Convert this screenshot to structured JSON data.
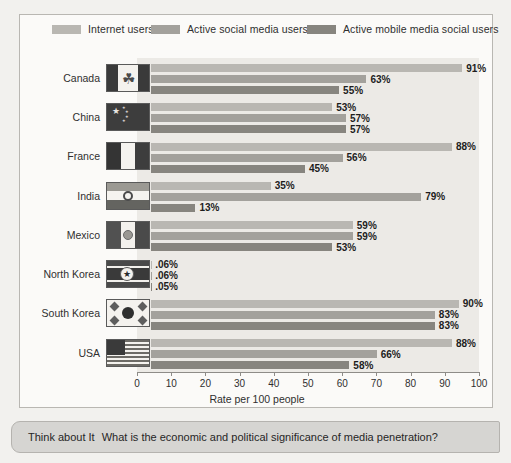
{
  "chart_data": {
    "type": "bar",
    "orientation": "horizontal",
    "title": "",
    "xlabel": "Rate per 100 people",
    "ylabel": "",
    "xlim": [
      0,
      100
    ],
    "xticks": [
      0,
      10,
      20,
      30,
      40,
      50,
      60,
      70,
      80,
      90,
      100
    ],
    "grid": false,
    "legend_position": "top",
    "categories": [
      "Canada",
      "China",
      "France",
      "India",
      "Mexico",
      "North Korea",
      "South Korea",
      "USA"
    ],
    "series": [
      {
        "name": "Internet users",
        "color": "#b9b7b2",
        "values": [
          91,
          53,
          88,
          35,
          59,
          0.06,
          90,
          88
        ],
        "labels": [
          "91%",
          "53%",
          "88%",
          "35%",
          "59%",
          ".06%",
          "90%",
          "88%"
        ]
      },
      {
        "name": "Active social media users",
        "color": "#a3a19c",
        "values": [
          63,
          57,
          56,
          79,
          59,
          0.06,
          83,
          66
        ],
        "labels": [
          "63%",
          "57%",
          "56%",
          "79%",
          "59%",
          ".06%",
          "83%",
          "66%"
        ]
      },
      {
        "name": "Active mobile media social users",
        "color": "#87857f",
        "values": [
          55,
          57,
          45,
          13,
          53,
          0.05,
          83,
          58
        ],
        "labels": [
          "55%",
          "57%",
          "45%",
          "13%",
          "53%",
          ".05%",
          "83%",
          "58%"
        ]
      }
    ]
  },
  "legend": {
    "items": [
      {
        "label": "Internet users",
        "swatch": "#b9b7b2"
      },
      {
        "label": "Active social media users",
        "swatch": "#a3a19c"
      },
      {
        "label": "Active mobile media social users",
        "swatch": "#87857f"
      }
    ]
  },
  "axis": {
    "title": "Rate per 100 people",
    "ticks": [
      "0",
      "10",
      "20",
      "30",
      "40",
      "50",
      "60",
      "70",
      "80",
      "90",
      "100"
    ]
  },
  "rows": [
    {
      "country": "Canada",
      "flag": "flag-canada"
    },
    {
      "country": "China",
      "flag": "flag-china"
    },
    {
      "country": "France",
      "flag": "flag-france"
    },
    {
      "country": "India",
      "flag": "flag-india"
    },
    {
      "country": "Mexico",
      "flag": "flag-mexico"
    },
    {
      "country": "North Korea",
      "flag": "flag-north-korea"
    },
    {
      "country": "South Korea",
      "flag": "flag-south-korea"
    },
    {
      "country": "USA",
      "flag": "flag-usa"
    }
  ],
  "footer": {
    "label": "Think about It",
    "text": "What is the economic and political significance of media penetration?"
  }
}
